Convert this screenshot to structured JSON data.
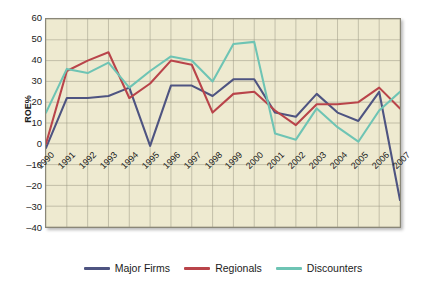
{
  "chart_data": {
    "type": "line",
    "title": "",
    "xlabel": "",
    "ylabel": "ROE%",
    "x": [
      1990,
      1991,
      1992,
      1993,
      1994,
      1995,
      1996,
      1997,
      1998,
      1999,
      2000,
      2001,
      2002,
      2003,
      2004,
      2005,
      2006,
      2007
    ],
    "categories": [
      "1990",
      "1991",
      "1992",
      "1993",
      "1994",
      "1995",
      "1996",
      "1997",
      "1998",
      "1999",
      "2000",
      "2001",
      "2002",
      "2003",
      "2004",
      "2005",
      "2006",
      "2007"
    ],
    "ylim": [
      -40,
      60
    ],
    "ytick_labels": [
      "60",
      "50",
      "40",
      "30",
      "20",
      "10",
      "0",
      "–10",
      "–20",
      "–30",
      "–40"
    ],
    "yticks": [
      60,
      50,
      40,
      30,
      20,
      10,
      0,
      -10,
      -20,
      -30,
      -40
    ],
    "grid": true,
    "legend_position": "bottom",
    "series": [
      {
        "name": "Major Firms",
        "color": "#4e5481",
        "values": [
          -2,
          22,
          22,
          23,
          27,
          -1,
          28,
          28,
          23,
          31,
          31,
          15,
          13,
          24,
          15,
          11,
          25,
          -27
        ]
      },
      {
        "name": "Regionals",
        "color": "#b9444a",
        "values": [
          0,
          35,
          40,
          44,
          22,
          29,
          40,
          38,
          15,
          24,
          25,
          16,
          9,
          19,
          19,
          20,
          27,
          17
        ]
      },
      {
        "name": "Discounters",
        "color": "#6ec4b4",
        "values": [
          15,
          36,
          34,
          39,
          27,
          35,
          42,
          40,
          30,
          48,
          49,
          5,
          2,
          17,
          8,
          1,
          16,
          25
        ]
      }
    ]
  },
  "legend": {
    "items": [
      {
        "label": "Major Firms",
        "color": "#4e5481"
      },
      {
        "label": "Regionals",
        "color": "#b9444a"
      },
      {
        "label": "Discounters",
        "color": "#6ec4b4"
      }
    ]
  },
  "axis": {
    "y_title": "ROE%"
  },
  "style": {
    "plot_background": "#eeead0",
    "grid_color": "#9b9884",
    "frame_color": "#8a8778",
    "page_background": "#ffffff",
    "text_color": "#1b1b1b"
  }
}
